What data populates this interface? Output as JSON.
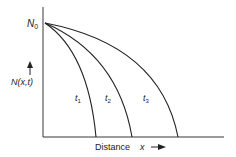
{
  "diagram": {
    "y_axis_label": "N(x,t)",
    "x_axis_label": "Distance",
    "x_axis_variable": "x",
    "origin_label_base": "N",
    "origin_label_sub": "0",
    "curves": [
      {
        "label_base": "t",
        "label_sub": "1",
        "end_x": 96
      },
      {
        "label_base": "t",
        "label_sub": "2",
        "end_x": 132
      },
      {
        "label_base": "t",
        "label_sub": "3",
        "end_x": 178
      }
    ],
    "colors": {
      "stroke": "#222222",
      "background": "#ffffff"
    }
  }
}
